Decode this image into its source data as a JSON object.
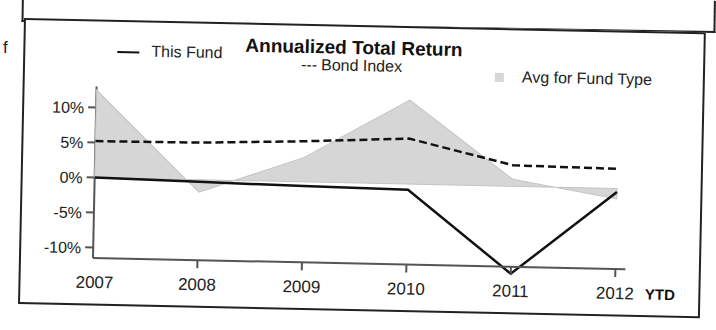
{
  "page": {
    "side_letter": "f"
  },
  "chart_data": {
    "type": "line",
    "title": "Annualized Total Return",
    "xlabel": "",
    "ylabel": "",
    "x_suffix": "YTD",
    "categories": [
      "2007",
      "2008",
      "2009",
      "2010",
      "2011",
      "2012"
    ],
    "yticks": [
      "10%",
      "5%",
      "0%",
      "-5%",
      "-10%"
    ],
    "ytick_values": [
      10,
      5,
      0,
      -5,
      -10
    ],
    "ylim": [
      -12.5,
      13
    ],
    "grid": false,
    "legend_position": "top",
    "series": [
      {
        "name": "This Fund",
        "style": "solid",
        "color": "#111111",
        "values": [
          0,
          -0.3,
          -0.6,
          -0.8,
          -12.5,
          -0.5
        ]
      },
      {
        "name": "Bond Index",
        "style": "dashed",
        "color": "#111111",
        "values": [
          5.2,
          5.3,
          5.8,
          6.5,
          3.0,
          2.8
        ]
      },
      {
        "name": "Avg for Fund Type",
        "style": "area",
        "color": "#d6d6d6",
        "values": [
          12.5,
          -1.8,
          3.5,
          12.0,
          1.0,
          -1.5
        ]
      }
    ]
  },
  "legend": {
    "this_fund": "This Fund",
    "bond_index": "Bond Index",
    "bond_index_marker": "---",
    "avg_fund_type": "Avg for Fund Type"
  }
}
